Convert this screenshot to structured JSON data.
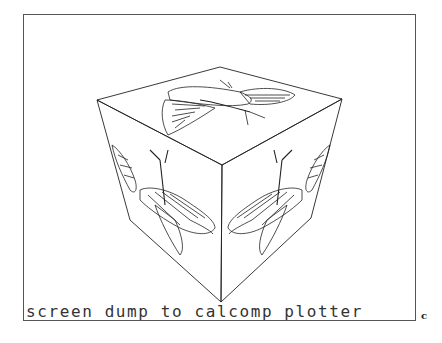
{
  "caption": "screen dump to calcomp plotter",
  "figure_letter": "c",
  "drawing": {
    "subject": "wireframe cube with butterfly drawn on each visible face",
    "faces": [
      "top",
      "left",
      "right"
    ],
    "line_color": "#222222"
  }
}
